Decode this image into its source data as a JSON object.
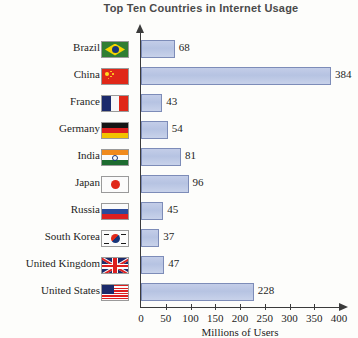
{
  "title": "Top Ten Countries in Internet Usage",
  "chart_data": {
    "type": "bar",
    "orientation": "horizontal",
    "title": "Top Ten Countries in Internet Usage",
    "xlabel": "Millions of Users",
    "ylabel": "",
    "xlim": [
      0,
      400
    ],
    "xticks": [
      0,
      50,
      100,
      150,
      200,
      250,
      300,
      350,
      400
    ],
    "grid": false,
    "legend": false,
    "categories": [
      "Brazil",
      "China",
      "France",
      "Germany",
      "India",
      "Japan",
      "Russia",
      "South Korea",
      "United Kingdom",
      "United States"
    ],
    "values": [
      68,
      384,
      43,
      54,
      81,
      96,
      45,
      37,
      47,
      228
    ],
    "bar_fill_color": "#bcc8e6",
    "bar_border_color": "#7d8cb8",
    "rows": [
      {
        "label": "Brazil",
        "value": 68,
        "value_label": "68",
        "flag": "flag-brazil"
      },
      {
        "label": "China",
        "value": 384,
        "value_label": "384",
        "flag": "flag-china"
      },
      {
        "label": "France",
        "value": 43,
        "value_label": "43",
        "flag": "flag-france"
      },
      {
        "label": "Germany",
        "value": 54,
        "value_label": "54",
        "flag": "flag-germany"
      },
      {
        "label": "India",
        "value": 81,
        "value_label": "81",
        "flag": "flag-india"
      },
      {
        "label": "Japan",
        "value": 96,
        "value_label": "96",
        "flag": "flag-japan"
      },
      {
        "label": "Russia",
        "value": 45,
        "value_label": "45",
        "flag": "flag-russia"
      },
      {
        "label": "South Korea",
        "value": 37,
        "value_label": "37",
        "flag": "flag-south-korea"
      },
      {
        "label": "United Kingdom",
        "value": 47,
        "value_label": "47",
        "flag": "flag-united-kingdom"
      },
      {
        "label": "United States",
        "value": 228,
        "value_label": "228",
        "flag": "flag-united-states"
      }
    ]
  },
  "axis": {
    "x_title": "Millions of Users",
    "tick_labels": [
      "0",
      "50",
      "100",
      "150",
      "200",
      "250",
      "300",
      "350",
      "400"
    ]
  }
}
